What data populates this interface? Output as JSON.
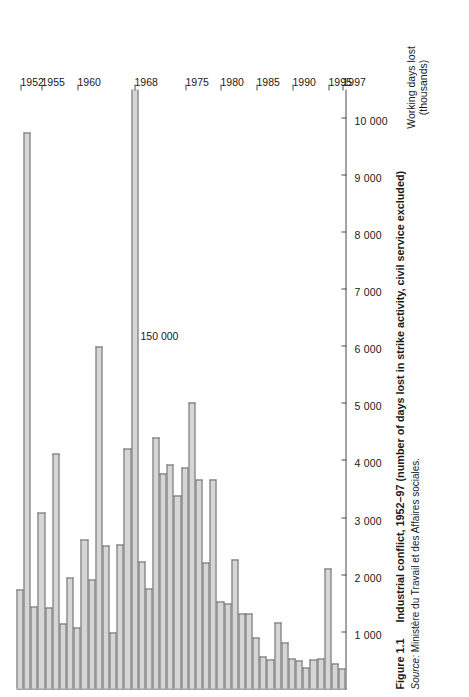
{
  "figure": {
    "number": "Figure 1.1",
    "title": "Industrial conflict, 1952–97 (number of days lost in strike activity, civil service excluded)",
    "source_label": "Source:",
    "source_text": "Ministère du Travail et des Affaires sociales.",
    "annotation": "150 000",
    "axis_title": "Working days lost\n(thousands)",
    "bar_fill": "#d6d6d6",
    "bar_stroke": "#6b6b6b",
    "axis_color": "#4a4a4a"
  },
  "chart_data": {
    "type": "bar",
    "orientation": "horizontal",
    "title": "Industrial conflict, 1952–97 (number of days lost in strike activity, civil service excluded)",
    "xlabel": "Working days lost (thousands)",
    "ylabel": "",
    "xlim": [
      0,
      10500
    ],
    "grid": false,
    "legend": null,
    "value_ticks": [
      1000,
      2000,
      3000,
      4000,
      5000,
      6000,
      7000,
      8000,
      9000,
      10000
    ],
    "value_tick_labels": [
      "1 000",
      "2 000",
      "3 000",
      "4 000",
      "5 000",
      "6 000",
      "7 000",
      "8 000",
      "9 000",
      "10 000"
    ],
    "year_tick_labels": [
      "1952",
      "1955",
      "1960",
      "1968",
      "1975",
      "1980",
      "1985",
      "1990",
      "1995",
      "1997"
    ],
    "annotations": [
      {
        "year": "1968",
        "text": "150 000",
        "note": "bar runs off scale"
      }
    ],
    "categories": [
      "1952",
      "1953",
      "1954",
      "1955",
      "1956",
      "1957",
      "1958",
      "1959",
      "1960",
      "1961",
      "1962",
      "1963",
      "1964",
      "1965",
      "1966",
      "1967",
      "1968",
      "1969",
      "1970",
      "1971",
      "1972",
      "1973",
      "1974",
      "1975",
      "1976",
      "1977",
      "1978",
      "1979",
      "1980",
      "1981",
      "1982",
      "1983",
      "1984",
      "1985",
      "1986",
      "1987",
      "1988",
      "1989",
      "1990",
      "1991",
      "1992",
      "1993",
      "1994",
      "1995",
      "1996",
      "1997"
    ],
    "values": [
      1733,
      9722,
      1440,
      3079,
      1423,
      4121,
      1138,
      1938,
      1070,
      2601,
      1901,
      5991,
      2497,
      980,
      2523,
      4204,
      150000,
      2224,
      1742,
      4388,
      3755,
      3915,
      3380,
      3869,
      5011,
      3666,
      2200,
      3657,
      1523,
      1496,
      2257,
      1320,
      1318,
      885,
      567,
      512,
      1158,
      797,
      528,
      497,
      359,
      511,
      521,
      2100,
      444,
      352
    ],
    "unit": "thousands of working days lost",
    "offscale_category": "1968",
    "offscale_value": 150000
  }
}
